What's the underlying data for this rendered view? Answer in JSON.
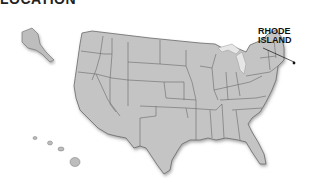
{
  "heading": "LOCATION",
  "map": {
    "title": "United States",
    "highlighted_state": "Rhode Island",
    "callout_label_line1": "RHODE",
    "callout_label_line2": "ISLAND",
    "fill_color": "#c4c4c4",
    "border_color": "#6a6a6a",
    "lakes_color": "#e8e8e8"
  }
}
